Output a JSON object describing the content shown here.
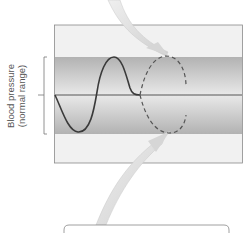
{
  "diagram": {
    "type": "homeostasis-feedback",
    "y_axis_label": {
      "line1": "Blood pressure",
      "line2": "(normal range)"
    },
    "panel": {
      "background": "#f0f0f0",
      "border": "#8a8a8a",
      "band_color_dark": "#b4b4b4",
      "band_color_light": "#e6e6e6",
      "setpoint_line_color": "#555555"
    },
    "curves": {
      "actual": {
        "style": "solid",
        "color": "#3c3c3c",
        "description": "blood pressure oscillation"
      },
      "projected": {
        "style": "dashed",
        "color": "#555555",
        "description": "projected deviation without correction"
      }
    },
    "arrows": [
      {
        "name": "top-arrow",
        "direction": "down-right",
        "color": "#d8d8d8"
      },
      {
        "name": "bottom-arrow",
        "direction": "up-right",
        "color": "#d8d8d8"
      }
    ],
    "label_box": {
      "text": ""
    }
  }
}
